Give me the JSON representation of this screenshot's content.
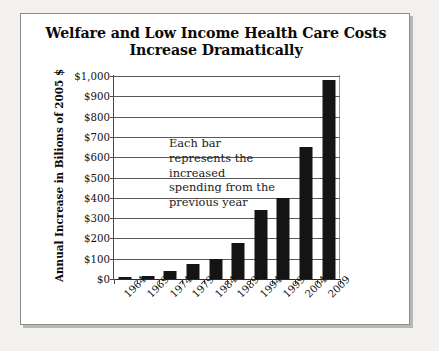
{
  "chart_data": {
    "type": "bar",
    "title": "Welfare and Low Income Health Care Costs Increase Dramatically",
    "title_line1": "Welfare and Low Income Health Care Costs",
    "title_line2": "Increase Dramatically",
    "xlabel": "",
    "ylabel": "Annual Increase in Bilions of 2005 $",
    "ylim": [
      0,
      1000
    ],
    "ytick_labels": [
      "$1,000",
      "$900",
      "$800",
      "$700",
      "$600",
      "$500",
      "$400",
      "$300",
      "$200",
      "$100",
      "$0"
    ],
    "ytick_values": [
      1000,
      900,
      800,
      700,
      600,
      500,
      400,
      300,
      200,
      100,
      0
    ],
    "grid": true,
    "legend": "none",
    "bar_color": "#141414",
    "categories": [
      "1964",
      "1969",
      "1974",
      "1979",
      "1984",
      "1989",
      "1994",
      "1999",
      "2004",
      "2009"
    ],
    "values": [
      8,
      15,
      40,
      72,
      100,
      175,
      340,
      400,
      650,
      978
    ],
    "annotations": [
      {
        "text": "Each bar represents the increased spending from the previous year",
        "lines": [
          "Each bar",
          "represents the",
          "increased",
          "spending from the",
          "previous year"
        ]
      }
    ]
  }
}
